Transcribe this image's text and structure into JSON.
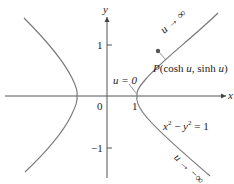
{
  "figure": {
    "axes": {
      "x_label": "x",
      "y_label": "y",
      "origin_label": "0",
      "x_ticks": [
        "1"
      ],
      "y_ticks": [
        "1",
        "−1"
      ]
    },
    "curve": {
      "equation_label": "x² − y² = 1",
      "equation_parts": {
        "x": "x",
        "x_exp": "2",
        "minus": " − ",
        "y": "y",
        "y_exp": "2",
        "rhs": " = 1"
      }
    },
    "annotations": {
      "point_label": "P(cosh u, sinh u)",
      "u_zero_label": "u = 0",
      "u_to_inf_label": "u → ∞",
      "u_to_neg_inf_label": "u → −∞"
    },
    "colors": {
      "curve": "#7a7a7a",
      "axis": "#555555",
      "point": "#555555",
      "text": "#222222"
    }
  }
}
